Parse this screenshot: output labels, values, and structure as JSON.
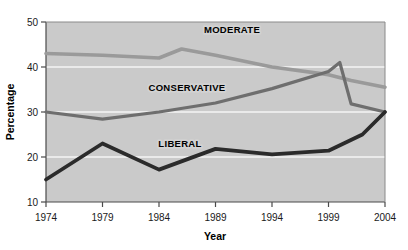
{
  "chart_data": {
    "type": "line",
    "title": "",
    "xlabel": "Year",
    "ylabel": "Percentage",
    "x": [
      1974,
      1979,
      1984,
      1986,
      1989,
      1994,
      1999,
      2000,
      2001,
      2004
    ],
    "xlim": [
      1974,
      2004
    ],
    "ylim": [
      10,
      50
    ],
    "xticks": [
      "1974",
      "1979",
      "1984",
      "1989",
      "1994",
      "1999",
      "2004"
    ],
    "yticks": [
      "10",
      "20",
      "30",
      "40",
      "50"
    ],
    "grid": "horizontal-white",
    "legend": "inline-labels",
    "plot_background": "#cacaca",
    "series": [
      {
        "name": "MODERATE",
        "color": "#9a9a9a",
        "label": "MODERATE",
        "points": [
          {
            "x": 1974,
            "y": 43.0
          },
          {
            "x": 1979,
            "y": 42.6
          },
          {
            "x": 1984,
            "y": 42.0
          },
          {
            "x": 1986,
            "y": 44.0
          },
          {
            "x": 1989,
            "y": 42.6
          },
          {
            "x": 1994,
            "y": 40.0
          },
          {
            "x": 1999,
            "y": 38.3
          },
          {
            "x": 2001,
            "y": 37.0
          },
          {
            "x": 2004,
            "y": 35.5
          }
        ]
      },
      {
        "name": "CONSERVATIVE",
        "color": "#6e6e6e",
        "label": "CONSERVATIVE",
        "points": [
          {
            "x": 1974,
            "y": 30.0
          },
          {
            "x": 1979,
            "y": 28.4
          },
          {
            "x": 1984,
            "y": 30.0
          },
          {
            "x": 1989,
            "y": 32.0
          },
          {
            "x": 1994,
            "y": 35.2
          },
          {
            "x": 1999,
            "y": 39.0
          },
          {
            "x": 2000,
            "y": 41.0
          },
          {
            "x": 2001,
            "y": 31.8
          },
          {
            "x": 2004,
            "y": 30.0
          }
        ]
      },
      {
        "name": "LIBERAL",
        "color": "#2b2b2b",
        "label": "LIBERAL",
        "points": [
          {
            "x": 1974,
            "y": 15.0
          },
          {
            "x": 1979,
            "y": 23.0
          },
          {
            "x": 1984,
            "y": 17.2
          },
          {
            "x": 1989,
            "y": 21.8
          },
          {
            "x": 1994,
            "y": 20.6
          },
          {
            "x": 1999,
            "y": 21.4
          },
          {
            "x": 2002,
            "y": 25.0
          },
          {
            "x": 2004,
            "y": 30.0
          }
        ]
      }
    ],
    "series_label_positions": [
      {
        "name": "MODERATE",
        "x": 232,
        "y": 33
      },
      {
        "name": "CONSERVATIVE",
        "x": 187,
        "y": 91
      },
      {
        "name": "LIBERAL",
        "x": 180,
        "y": 147
      }
    ]
  }
}
